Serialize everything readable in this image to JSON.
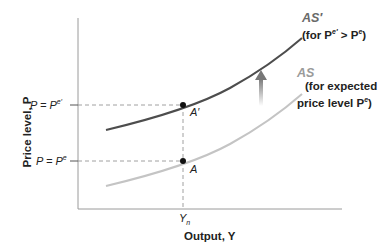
{
  "diagram": {
    "y_axis_label": "Price level, P",
    "x_axis_label": "Output, Y",
    "y_ticks": [
      {
        "label_left": "P = P",
        "sup": "e′",
        "y": 105
      },
      {
        "label_left": "P = P",
        "sup": "e",
        "y": 161
      }
    ],
    "x_ticks": [
      {
        "label": "Y",
        "sub": "n",
        "x": 183
      }
    ],
    "curves": [
      {
        "name": "AS′",
        "note_line1": "(for P",
        "note_sup1": "e′",
        "note_mid": " > P",
        "note_sup2": "e",
        "note_end": ")",
        "color": "#4d4d4d"
      },
      {
        "name": "AS",
        "note_line1": "(for expected",
        "note_line2": "price level P",
        "note_sup": "e",
        "note_end": ")",
        "color": "#c4c4c4"
      }
    ],
    "points": [
      {
        "label": "A′"
      },
      {
        "label": "A"
      }
    ],
    "shift_arrow": "upward"
  }
}
